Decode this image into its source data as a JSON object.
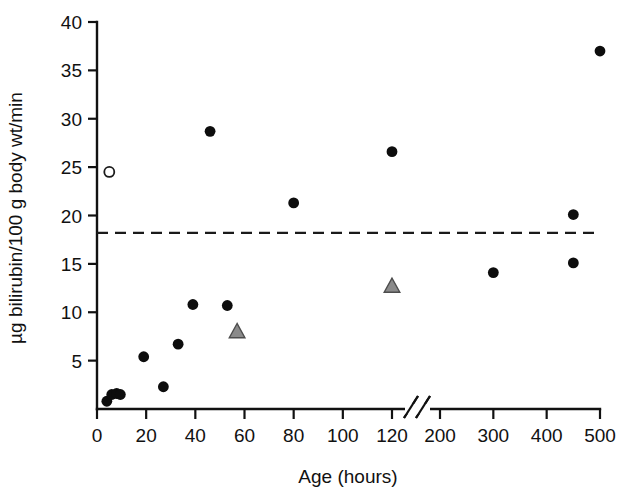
{
  "chart_data": {
    "type": "scatter",
    "title": "",
    "xlabel": "Age (hours)",
    "ylabel": "µg bilirubin/100 g body wt/min",
    "xticks": [
      0,
      20,
      40,
      60,
      80,
      100,
      120,
      200,
      300,
      400,
      500
    ],
    "xtick_labels": [
      "0",
      "20",
      "40",
      "60",
      "80",
      "100",
      "120",
      "200",
      "300",
      "400",
      "500"
    ],
    "yticks": [
      5,
      10,
      15,
      20,
      25,
      30,
      35,
      40
    ],
    "ytick_labels": [
      "5",
      "10",
      "15",
      "20",
      "25",
      "30",
      "35",
      "40"
    ],
    "ylim": [
      0,
      40
    ],
    "grid": false,
    "legend": "none",
    "axis_break": {
      "present": true,
      "between": [
        120,
        200
      ],
      "style": "double-slash"
    },
    "annotations": [
      {
        "kind": "threshold-line",
        "style": "dashed",
        "orientation": "horizontal",
        "y": 18.2,
        "label": ""
      }
    ],
    "series": [
      {
        "name": "filled-circle",
        "marker": "filled-circle",
        "color": "#0d0d0d",
        "points": [
          {
            "x": 4,
            "y": 0.8
          },
          {
            "x": 6,
            "y": 1.5
          },
          {
            "x": 8,
            "y": 1.6
          },
          {
            "x": 9.5,
            "y": 1.5
          },
          {
            "x": 19,
            "y": 5.4
          },
          {
            "x": 27,
            "y": 2.3
          },
          {
            "x": 33,
            "y": 6.7
          },
          {
            "x": 39,
            "y": 10.8
          },
          {
            "x": 46,
            "y": 28.7
          },
          {
            "x": 53,
            "y": 10.7
          },
          {
            "x": 80,
            "y": 21.3
          },
          {
            "x": 120,
            "y": 26.6
          },
          {
            "x": 300,
            "y": 14.1
          },
          {
            "x": 450,
            "y": 20.1
          },
          {
            "x": 450,
            "y": 15.1
          },
          {
            "x": 500,
            "y": 37.0
          }
        ]
      },
      {
        "name": "open-circle",
        "marker": "open-circle",
        "color": "#ffffff",
        "points": [
          {
            "x": 5,
            "y": 24.5
          }
        ]
      },
      {
        "name": "gray-triangle",
        "marker": "filled-triangle",
        "color": "#8a8a8a",
        "points": [
          {
            "x": 57,
            "y": 8.0
          },
          {
            "x": 120,
            "y": 12.7
          }
        ]
      }
    ]
  },
  "axes": {
    "x_title": "Age (hours)",
    "y_title": "µg bilirubin/100 g body wt/min"
  }
}
